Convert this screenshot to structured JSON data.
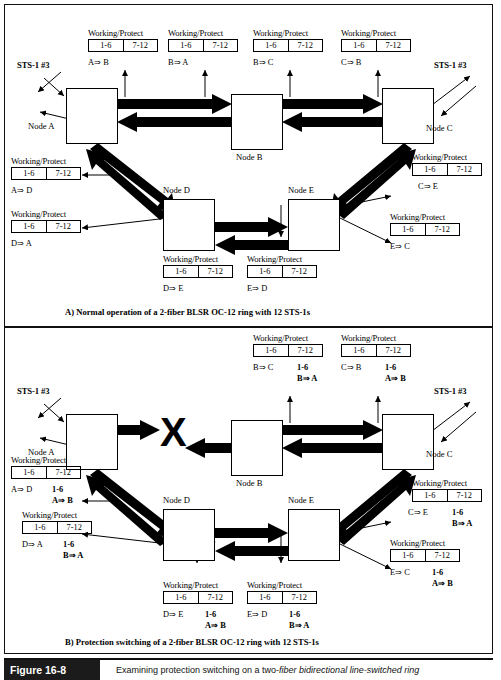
{
  "figure": {
    "number": "Figure 16-8",
    "caption_pre": "Examining protection switching on a two-",
    "caption_em": "fiber bidirectional line-switched ring",
    "caption_full": "Examining protection switching on a two-fiber bidirectional line-switched ring"
  },
  "labels": {
    "working_protect": "Working/Protect",
    "range_low": "1-6",
    "range_high": "7-12",
    "sts": "STS-1 #3",
    "fault_marker": "X"
  },
  "panelA": {
    "caption": "A) Normal operation of a 2-fiber BLSR OC-12 ring with 12 STS-1s",
    "nodes": [
      {
        "id": "node-a",
        "label": "Node A"
      },
      {
        "id": "node-b",
        "label": "Node B"
      },
      {
        "id": "node-c",
        "label": "Node C"
      },
      {
        "id": "node-d",
        "label": "Node D"
      },
      {
        "id": "node-e",
        "label": "Node E"
      }
    ],
    "sts_left": "STS-1 #3",
    "sts_right": "STS-1 #3",
    "tables": [
      {
        "id": "a-to-b",
        "title": "Working/Protect",
        "low": "1-6",
        "high": "7-12",
        "flow": "A⇒ B"
      },
      {
        "id": "b-to-a",
        "title": "Working/Protect",
        "low": "1-6",
        "high": "7-12",
        "flow": "B⇒ A"
      },
      {
        "id": "b-to-c",
        "title": "Working/Protect",
        "low": "1-6",
        "high": "7-12",
        "flow": "B⇒ C"
      },
      {
        "id": "c-to-b",
        "title": "Working/Protect",
        "low": "1-6",
        "high": "7-12",
        "flow": "C⇒ B"
      },
      {
        "id": "a-to-d",
        "title": "Working/Protect",
        "low": "1-6",
        "high": "7-12",
        "flow": "A⇒ D"
      },
      {
        "id": "d-to-a",
        "title": "Working/Protect",
        "low": "1-6",
        "high": "7-12",
        "flow": "D⇒ A"
      },
      {
        "id": "d-to-e",
        "title": "Working/Protect",
        "low": "1-6",
        "high": "7-12",
        "flow": "D⇒ E"
      },
      {
        "id": "e-to-d",
        "title": "Working/Protect",
        "low": "1-6",
        "high": "7-12",
        "flow": "E⇒ D"
      },
      {
        "id": "c-to-e",
        "title": "Working/Protect",
        "low": "1-6",
        "high": "7-12",
        "flow": "C⇒ E"
      },
      {
        "id": "e-to-c",
        "title": "Working/Protect",
        "low": "1-6",
        "high": "7-12",
        "flow": "E⇒ C"
      }
    ]
  },
  "panelB": {
    "caption": "B) Protection switching of a 2-fiber BLSR OC-12 ring with 12 STS-1s",
    "nodes": [
      {
        "id": "node-a",
        "label": "Node A"
      },
      {
        "id": "node-b",
        "label": "Node B"
      },
      {
        "id": "node-c",
        "label": "Node C"
      },
      {
        "id": "node-d",
        "label": "Node D"
      },
      {
        "id": "node-e",
        "label": "Node E"
      }
    ],
    "sts_left": "STS-1 #3",
    "sts_right": "STS-1 #3",
    "fault": "X",
    "tables": [
      {
        "id": "b-to-c",
        "title": "Working/Protect",
        "low": "1-6",
        "high": "7-12",
        "flow": "B⇒ C",
        "prot_range": "1-6",
        "prot_flow": "B⇒ A"
      },
      {
        "id": "c-to-b",
        "title": "Working/Protect",
        "low": "1-6",
        "high": "7-12",
        "flow": "C⇒ B",
        "prot_range": "1-6",
        "prot_flow": "A⇒ B"
      },
      {
        "id": "a-to-d",
        "title": "Working/Protect",
        "low": "1-6",
        "high": "7-12",
        "flow": "A⇒ D",
        "prot_range": "1-6",
        "prot_flow": "A⇒ B"
      },
      {
        "id": "d-to-a",
        "title": "Working/Protect",
        "low": "1-6",
        "high": "7-12",
        "flow": "D⇒ A",
        "prot_range": "1-6",
        "prot_flow": "B⇒ A"
      },
      {
        "id": "d-to-e",
        "title": "Working/Protect",
        "low": "1-6",
        "high": "7-12",
        "flow": "D⇒ E",
        "prot_range": "1-6",
        "prot_flow": "A⇒ B"
      },
      {
        "id": "e-to-d",
        "title": "Working/Protect",
        "low": "1-6",
        "high": "7-12",
        "flow": "E⇒ D",
        "prot_range": "1-6",
        "prot_flow": "B⇒ A"
      },
      {
        "id": "c-to-e",
        "title": "Working/Protect",
        "low": "1-6",
        "high": "7-12",
        "flow": "C⇒ E",
        "prot_range": "1-6",
        "prot_flow": "B⇒ A"
      },
      {
        "id": "e-to-c",
        "title": "Working/Protect",
        "low": "1-6",
        "high": "7-12",
        "flow": "E⇒ C",
        "prot_range": "1-6",
        "prot_flow": "A⇒ B"
      }
    ]
  }
}
